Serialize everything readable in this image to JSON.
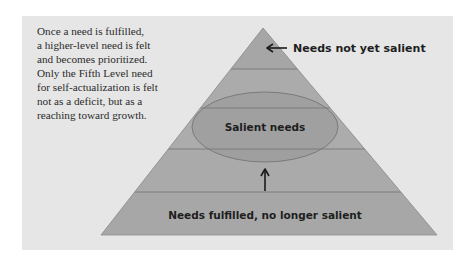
{
  "caption": {
    "lines": [
      "Once a need is fulfilled,",
      "a higher-level need is felt",
      "and becomes prioritized.",
      "Only the Fifth Level need",
      "for self-actualization is felt",
      "not as a deficit, but as a",
      "reaching toward growth."
    ]
  },
  "pyramid": {
    "levels": 5,
    "colors": {
      "paper": "#e6e6e6",
      "pyramid_fill": "#a9a9a9",
      "band_line": "#7d7d7d",
      "ellipse_fill": "#9c9c9c",
      "ellipse_stroke": "#7a7a7a",
      "text": "#1e1e1e"
    }
  },
  "labels": {
    "top": "Needs not yet salient",
    "middle": "Salient needs",
    "bottom": "Needs fulfilled, no longer salient"
  },
  "icons": {
    "top_arrow": "arrow-left-icon",
    "middle_arrow": "arrow-up-icon"
  }
}
